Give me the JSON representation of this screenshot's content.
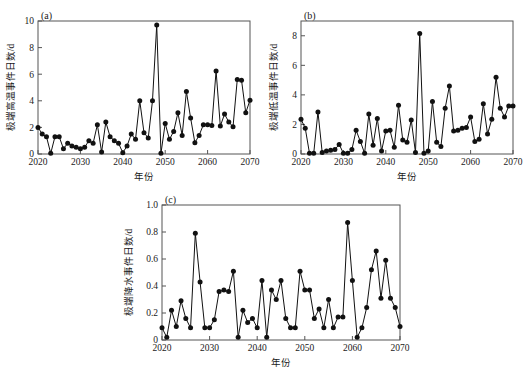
{
  "figure": {
    "background": "#ffffff",
    "line_color": "#111111",
    "axis_color": "#555555"
  },
  "chart_data": [
    {
      "type": "line",
      "panel_tag": "(a)",
      "title": "",
      "xlabel": "年份",
      "ylabel": "极端高温事件日数/d",
      "xlim": [
        2020,
        2070
      ],
      "ylim": [
        0,
        10
      ],
      "xticks": [
        2020,
        2030,
        2040,
        2050,
        2060,
        2070
      ],
      "yticks": [
        0,
        2,
        4,
        6,
        8,
        10
      ],
      "grid": false,
      "legend": null,
      "marker": "filled-circle",
      "x": [
        2020,
        2021,
        2022,
        2023,
        2024,
        2025,
        2026,
        2027,
        2028,
        2029,
        2030,
        2031,
        2032,
        2033,
        2034,
        2035,
        2036,
        2037,
        2038,
        2039,
        2040,
        2041,
        2042,
        2043,
        2044,
        2045,
        2046,
        2047,
        2048,
        2049,
        2050,
        2051,
        2052,
        2053,
        2054,
        2055,
        2056,
        2057,
        2058,
        2059,
        2060,
        2061,
        2062,
        2063,
        2064,
        2065,
        2066,
        2067,
        2068,
        2069,
        2070
      ],
      "values": [
        2.0,
        1.5,
        1.3,
        0.05,
        1.3,
        1.3,
        0.4,
        0.8,
        0.6,
        0.5,
        0.4,
        0.5,
        1.0,
        0.8,
        2.2,
        0.15,
        2.4,
        1.3,
        1.0,
        0.8,
        0.1,
        0.6,
        1.5,
        1.1,
        4.0,
        1.6,
        1.2,
        4.0,
        9.7,
        0.05,
        2.3,
        1.1,
        1.7,
        3.1,
        1.4,
        4.7,
        2.7,
        0.85,
        1.4,
        2.2,
        2.2,
        2.15,
        6.25,
        2.1,
        3.0,
        2.4,
        2.05,
        5.6,
        5.55,
        3.1,
        4.05
      ]
    },
    {
      "type": "line",
      "panel_tag": "(b)",
      "title": "",
      "xlabel": "年份",
      "ylabel": "极端低温事件日数/d",
      "xlim": [
        2020,
        2070
      ],
      "ylim": [
        0,
        9
      ],
      "xticks": [
        2020,
        2030,
        2040,
        2050,
        2060,
        2070
      ],
      "yticks": [
        0,
        2,
        4,
        6,
        8
      ],
      "grid": false,
      "legend": null,
      "marker": "filled-circle",
      "x": [
        2020,
        2021,
        2022,
        2023,
        2024,
        2025,
        2026,
        2027,
        2028,
        2029,
        2030,
        2031,
        2032,
        2033,
        2034,
        2035,
        2036,
        2037,
        2038,
        2039,
        2040,
        2041,
        2042,
        2043,
        2044,
        2045,
        2046,
        2047,
        2048,
        2049,
        2050,
        2051,
        2052,
        2053,
        2054,
        2055,
        2056,
        2057,
        2058,
        2059,
        2060,
        2061,
        2062,
        2063,
        2064,
        2065,
        2066,
        2067,
        2068,
        2069,
        2070
      ],
      "values": [
        2.35,
        1.75,
        0.05,
        0.05,
        2.85,
        0.1,
        0.2,
        0.25,
        0.3,
        0.65,
        0.05,
        0.05,
        0.3,
        1.6,
        0.85,
        0.05,
        2.7,
        0.6,
        2.4,
        0.2,
        1.55,
        1.6,
        0.45,
        3.3,
        0.95,
        0.8,
        2.3,
        0.1,
        8.15,
        0.05,
        0.2,
        3.55,
        0.8,
        0.5,
        3.1,
        4.6,
        1.55,
        1.6,
        1.75,
        1.8,
        2.5,
        0.85,
        1.0,
        3.4,
        1.35,
        2.35,
        5.2,
        3.1,
        2.5,
        3.25,
        3.25
      ]
    },
    {
      "type": "line",
      "panel_tag": "(c)",
      "title": "",
      "xlabel": "年份",
      "ylabel": "极端降水事件日数/d",
      "xlim": [
        2020,
        2070
      ],
      "ylim": [
        0,
        1.0
      ],
      "xticks": [
        2020,
        2030,
        2040,
        2050,
        2060,
        2070
      ],
      "yticks": [
        "0",
        "0.2",
        "0.4",
        "0.6",
        "0.8",
        "1.0"
      ],
      "ytick_values": [
        0,
        0.2,
        0.4,
        0.6,
        0.8,
        1.0
      ],
      "grid": false,
      "legend": null,
      "marker": "filled-circle",
      "x": [
        2020,
        2021,
        2022,
        2023,
        2024,
        2025,
        2026,
        2027,
        2028,
        2029,
        2030,
        2031,
        2032,
        2033,
        2034,
        2035,
        2036,
        2037,
        2038,
        2039,
        2040,
        2041,
        2042,
        2043,
        2044,
        2045,
        2046,
        2047,
        2048,
        2049,
        2050,
        2051,
        2052,
        2053,
        2054,
        2055,
        2056,
        2057,
        2058,
        2059,
        2060,
        2061,
        2062,
        2063,
        2064,
        2065,
        2066,
        2067,
        2068,
        2069,
        2070
      ],
      "values": [
        0.09,
        0.02,
        0.22,
        0.1,
        0.29,
        0.16,
        0.09,
        0.79,
        0.43,
        0.09,
        0.09,
        0.15,
        0.36,
        0.37,
        0.36,
        0.51,
        0.02,
        0.22,
        0.13,
        0.16,
        0.09,
        0.44,
        0.02,
        0.37,
        0.3,
        0.44,
        0.16,
        0.09,
        0.09,
        0.51,
        0.37,
        0.37,
        0.16,
        0.23,
        0.09,
        0.3,
        0.09,
        0.17,
        0.17,
        0.87,
        0.44,
        0.02,
        0.09,
        0.24,
        0.52,
        0.66,
        0.31,
        0.59,
        0.31,
        0.24,
        0.1
      ]
    }
  ]
}
